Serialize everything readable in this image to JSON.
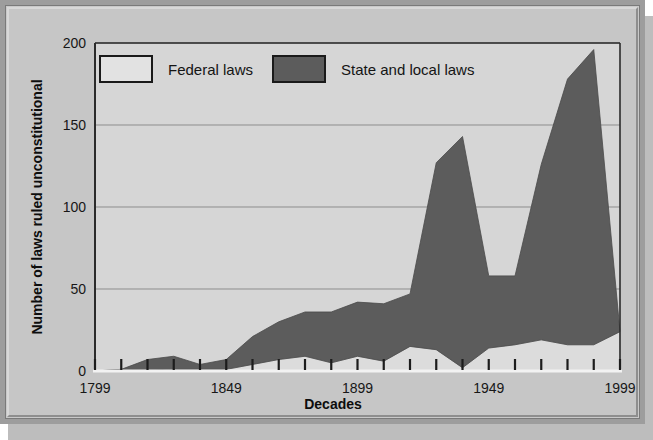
{
  "figure": {
    "background": "#c6c6c6",
    "plot_background": "#d6d6d6",
    "frame_color": "#9d9d9d"
  },
  "legend": {
    "position": "top-left-inside",
    "entries": [
      {
        "label": "Federal laws",
        "color": "#dcdcdc",
        "border": "#1a1a1a"
      },
      {
        "label": "State and local laws",
        "color": "#5c5c5c",
        "border": "#1a1a1a"
      }
    ]
  },
  "axes": {
    "y_label": "Number of laws ruled unconstitutional",
    "x_label": "Decades",
    "y_ticks": [
      "0",
      "50",
      "100",
      "150",
      "200"
    ],
    "x_ticks": [
      "1799",
      "1849",
      "1899",
      "1949",
      "1999"
    ]
  },
  "chart_data": {
    "type": "area",
    "title": "",
    "subtitle": "",
    "xlabel": "Decades",
    "ylabel": "Number of laws ruled unconstitutional",
    "xlim": [
      1799,
      1999
    ],
    "ylim": [
      0,
      200
    ],
    "ytick_values": [
      0,
      50,
      100,
      150,
      200
    ],
    "xtick_values": [
      1799,
      1849,
      1899,
      1949,
      1999
    ],
    "grid": "horizontal",
    "stacked": true,
    "legend_position": "upper-left inside plot",
    "annotations": [],
    "x": [
      1799,
      1809,
      1819,
      1829,
      1839,
      1849,
      1859,
      1869,
      1879,
      1889,
      1899,
      1909,
      1919,
      1929,
      1939,
      1949,
      1959,
      1969,
      1979,
      1989,
      1999
    ],
    "categories": [
      "1799",
      "1809",
      "1819",
      "1829",
      "1839",
      "1849",
      "1859",
      "1869",
      "1879",
      "1889",
      "1899",
      "1909",
      "1919",
      "1929",
      "1939",
      "1949",
      "1959",
      "1969",
      "1979",
      "1989",
      "1999"
    ],
    "series": [
      {
        "name": "Federal laws",
        "color": "#dcdcdc",
        "values": [
          0,
          1,
          0,
          1,
          1,
          1,
          4,
          7,
          9,
          5,
          9,
          6,
          15,
          13,
          2,
          14,
          16,
          19,
          16,
          16,
          24
        ]
      },
      {
        "name": "State and local laws",
        "color": "#5c5c5c",
        "values": [
          0,
          0,
          7,
          8,
          3,
          6,
          17,
          23,
          27,
          31,
          33,
          35,
          32,
          114,
          141,
          44,
          42,
          107,
          162,
          180,
          0
        ]
      }
    ],
    "series_totals": {
      "name": "Total (stacked top edge)",
      "values": [
        0,
        1,
        7,
        9,
        4,
        7,
        21,
        30,
        36,
        36,
        42,
        41,
        47,
        127,
        143,
        58,
        58,
        126,
        178,
        196,
        24
      ]
    },
    "notable_points": [
      {
        "label": "first major peak",
        "x": 1939,
        "y": 143
      },
      {
        "label": "mid-century dip",
        "x": 1959,
        "y": 58
      },
      {
        "label": "maximum",
        "x": 1989,
        "y": 196
      }
    ]
  }
}
